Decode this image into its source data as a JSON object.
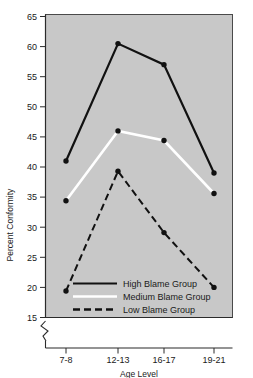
{
  "chart_data": {
    "type": "line",
    "title": "",
    "xlabel": "Age Level",
    "ylabel": "Percent Conformity",
    "categories": [
      "7-8",
      "12-13",
      "16-17",
      "19-21"
    ],
    "xtick_labels": [
      "7-8",
      "12-13",
      "16-17",
      "19-21"
    ],
    "ytick_labels": [
      "15",
      "20",
      "25",
      "30",
      "35",
      "40",
      "45",
      "50",
      "55",
      "60",
      "65"
    ],
    "ytick_values": [
      15,
      20,
      25,
      30,
      35,
      40,
      45,
      50,
      55,
      60,
      65
    ],
    "ylim": [
      15,
      65
    ],
    "y_axis_break": true,
    "grid": false,
    "legend_position": "inside-bottom-center",
    "plot_background": "#c8c8c8",
    "series": [
      {
        "name": "High Blame Group",
        "label": "High Blame Group",
        "values": [
          41.0,
          60.5,
          57.0,
          39.0
        ],
        "color": "#111111",
        "style": "solid",
        "marker": "circle",
        "marker_color": "#111111"
      },
      {
        "name": "Medium Blame Group",
        "label": "Medium Blame Group",
        "values": [
          34.4,
          46.0,
          44.4,
          35.6
        ],
        "color": "#ffffff",
        "style": "solid",
        "marker": "circle",
        "marker_color": "#111111"
      },
      {
        "name": "Low Blame Group",
        "label": "Low Blame Group",
        "values": [
          19.4,
          39.3,
          29.1,
          20.0
        ],
        "color": "#111111",
        "style": "dashed",
        "marker": "circle",
        "marker_color": "#111111"
      }
    ]
  },
  "legend": {
    "entries": [
      {
        "label": "High Blame Group"
      },
      {
        "label": "Medium Blame Group"
      },
      {
        "label": "Low Blame Group"
      }
    ]
  },
  "axes": {
    "y_title": "Percent Conformity",
    "x_title": "Age Level"
  }
}
